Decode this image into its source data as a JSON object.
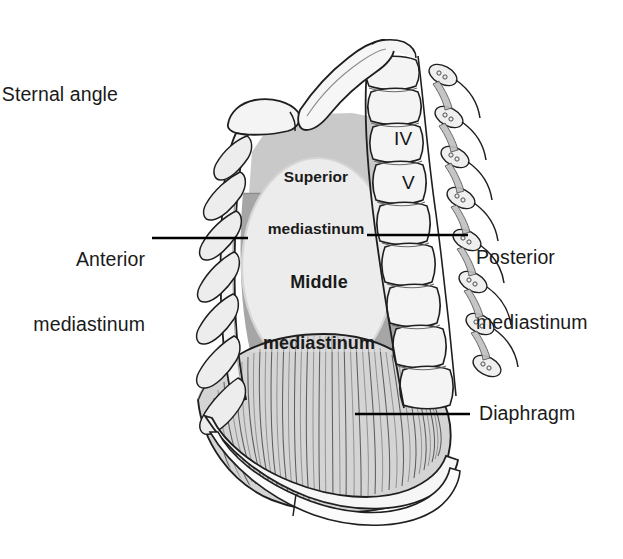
{
  "figure": {
    "background_color": "#ffffff",
    "ink_color": "#1a1a1a"
  },
  "palette": {
    "bone_fill": "#f2f2f2",
    "bone_shade": "#dcdcdc",
    "cartilage_fill": "#e6e6e6",
    "superior_mediastinum_fill": "#c9c9c9",
    "anterior_posterior_mediastinum_fill": "#a6a6a6",
    "middle_mediastinum_fill": "#ececec",
    "diaphragm_fill": "#d4d4d4",
    "diaphragm_fiber": "#5a5a5a",
    "outline": "#1f1f1f",
    "leader_line": "#000000"
  },
  "labels": {
    "sternal_angle": {
      "text": "Sternal angle",
      "position": "upper-left",
      "has_leader_line": false
    },
    "anterior_mediastinum": {
      "line1": "Anterior",
      "line2": "mediastinum",
      "position": "left",
      "has_leader_line": true
    },
    "posterior_mediastinum": {
      "line1": "Posterior",
      "line2": "mediastinum",
      "position": "right",
      "has_leader_line": true
    },
    "diaphragm": {
      "text": "Diaphragm",
      "position": "lower-right",
      "has_leader_line": true
    },
    "superior_mediastinum": {
      "line1": "Superior",
      "line2": "mediastinum",
      "position": "inside-top",
      "bold": true
    },
    "middle_mediastinum": {
      "line1": "Middle",
      "line2": "mediastinum",
      "position": "inside-center",
      "bold": true
    }
  },
  "vertebrae": [
    {
      "name": "vertebra-IV",
      "numeral": "IV"
    },
    {
      "name": "vertebra-V",
      "numeral": "V"
    }
  ],
  "caption": {
    "text": " "
  }
}
